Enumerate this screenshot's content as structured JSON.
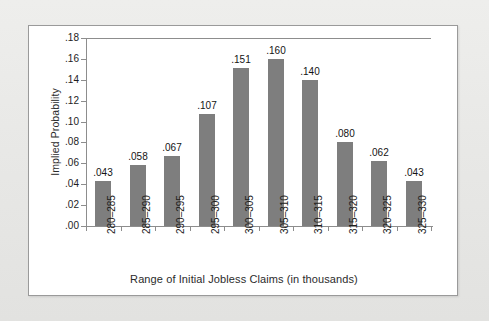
{
  "chart_data": {
    "type": "bar",
    "title": "",
    "xlabel": "Range of Initial Jobless Claims (in thousands)",
    "ylabel": "Implied Probability",
    "categories": [
      "280–285",
      "285–290",
      "290–295",
      "295–300",
      "300–305",
      "305–310",
      "310–315",
      "315–320",
      "320–325",
      "325–330"
    ],
    "values": [
      0.043,
      0.058,
      0.067,
      0.107,
      0.151,
      0.16,
      0.14,
      0.08,
      0.062,
      0.043
    ],
    "value_labels": [
      ".043",
      ".058",
      ".067",
      ".107",
      ".151",
      ".160",
      ".140",
      ".080",
      ".062",
      ".043"
    ],
    "ylim": [
      0.0,
      0.18
    ],
    "ytick_values": [
      0.0,
      0.02,
      0.04,
      0.06,
      0.08,
      0.1,
      0.12,
      0.14,
      0.16,
      0.18
    ],
    "ytick_labels": [
      ".00",
      ".02",
      ".04",
      ".06",
      ".08",
      ".10",
      ".12",
      ".14",
      ".16",
      ".18"
    ],
    "grid": false,
    "legend": null,
    "bar_color": "#7e7e7e",
    "axis_color": "#8d8d8d",
    "panel_background": "#ffffff",
    "page_background": "#e9e9e7"
  }
}
